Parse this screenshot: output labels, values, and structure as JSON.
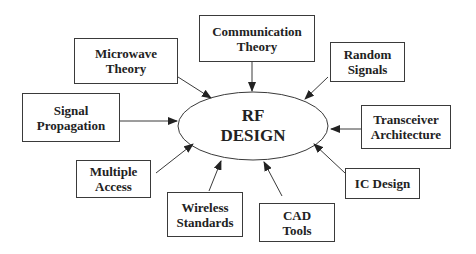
{
  "diagram": {
    "center": {
      "lines": [
        "RF",
        "DESIGN"
      ]
    },
    "nodes": [
      {
        "id": "communication-theory",
        "lines": [
          "Communication",
          "Theory"
        ]
      },
      {
        "id": "microwave-theory",
        "lines": [
          "Microwave",
          "Theory"
        ]
      },
      {
        "id": "random-signals",
        "lines": [
          "Random",
          "Signals"
        ]
      },
      {
        "id": "signal-propagation",
        "lines": [
          "Signal",
          "Propagation"
        ]
      },
      {
        "id": "transceiver-architecture",
        "lines": [
          "Transceiver",
          "Architecture"
        ]
      },
      {
        "id": "multiple-access",
        "lines": [
          "Multiple",
          "Access"
        ]
      },
      {
        "id": "ic-design",
        "lines": [
          "IC Design"
        ]
      },
      {
        "id": "wireless-standards",
        "lines": [
          "Wireless",
          "Standards"
        ]
      },
      {
        "id": "cad-tools",
        "lines": [
          "CAD",
          "Tools"
        ]
      }
    ],
    "colors": {
      "stroke": "#3a3a3a",
      "text": "#222222",
      "background": "#ffffff"
    }
  }
}
